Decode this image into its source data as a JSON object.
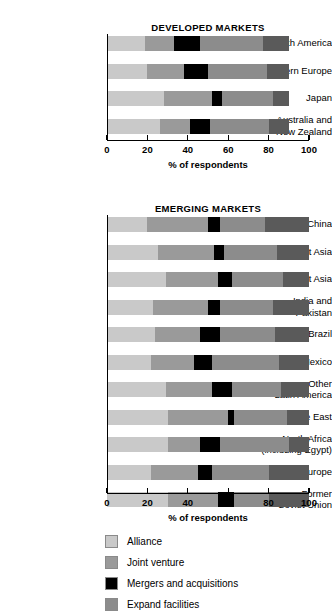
{
  "chart_data": [
    {
      "type": "bar",
      "orientation": "horizontal",
      "stacked": true,
      "title": "DEVELOPED MARKETS",
      "xlabel": "% of respondents",
      "ylabel": "",
      "xlim": [
        0,
        100
      ],
      "xticks": [
        0,
        20,
        40,
        60,
        80,
        100
      ],
      "xticklabels": [
        "0",
        "20",
        "40",
        "60",
        "80",
        "100"
      ],
      "grid": false,
      "legend_position": "bottom",
      "categories": [
        "North America",
        "Western Europe",
        "Japan",
        "Australia and\nNew Zealand"
      ],
      "series": [
        {
          "name": "Alliance",
          "color": "#c9c9c9",
          "values": [
            19,
            20,
            28,
            26
          ]
        },
        {
          "name": "Joint venture",
          "color": "#9a9a9a",
          "values": [
            14,
            18,
            24,
            15
          ]
        },
        {
          "name": "Mergers and acquisitions",
          "color": "#000000",
          "values": [
            13,
            12,
            5,
            10
          ]
        },
        {
          "name": "Expand facilities",
          "color": "#8c8c8c",
          "values": [
            31,
            29,
            25,
            29
          ]
        },
        {
          "name": "Other",
          "color": "#5a5a5a",
          "values": [
            13,
            11,
            8,
            10
          ]
        }
      ]
    },
    {
      "type": "bar",
      "orientation": "horizontal",
      "stacked": true,
      "title": "EMERGING MARKETS",
      "xlabel": "% of respondents",
      "ylabel": "",
      "xlim": [
        0,
        100
      ],
      "xticks": [
        0,
        20,
        40,
        60,
        80,
        100
      ],
      "xticklabels": [
        "0",
        "20",
        "40",
        "60",
        "80",
        "100"
      ],
      "grid": false,
      "legend_position": "bottom",
      "categories": [
        "China",
        "Southeast Asia",
        "Other East Asia",
        "India and\nPakistan",
        "Brazil",
        "Mexico",
        "Other\nLatin America",
        "Middle East",
        "North Africa\n(including Egypt)",
        "Eastern Europe",
        "Former\nSoviet Union"
      ],
      "series": [
        {
          "name": "Alliance",
          "color": "#c9c9c9",
          "values": [
            20,
            25,
            29,
            23,
            24,
            22,
            29,
            30,
            30,
            22,
            30
          ]
        },
        {
          "name": "Joint venture",
          "color": "#9a9a9a",
          "values": [
            30,
            28,
            26,
            27,
            22,
            21,
            23,
            30,
            16,
            23,
            25
          ]
        },
        {
          "name": "Mergers and acquisitions",
          "color": "#000000",
          "values": [
            6,
            5,
            7,
            6,
            10,
            9,
            10,
            3,
            10,
            7,
            8
          ]
        },
        {
          "name": "Expand facilities",
          "color": "#8c8c8c",
          "values": [
            22,
            26,
            25,
            26,
            27,
            33,
            24,
            26,
            34,
            28,
            17
          ]
        },
        {
          "name": "Other",
          "color": "#5a5a5a",
          "values": [
            22,
            16,
            13,
            18,
            17,
            15,
            14,
            11,
            10,
            20,
            20
          ]
        }
      ]
    }
  ],
  "legend": {
    "items": [
      {
        "label": "Alliance",
        "color": "#c9c9c9"
      },
      {
        "label": "Joint venture",
        "color": "#9a9a9a"
      },
      {
        "label": "Mergers and acquisitions",
        "color": "#000000"
      },
      {
        "label": "Expand facilities",
        "color": "#8c8c8c"
      }
    ]
  }
}
